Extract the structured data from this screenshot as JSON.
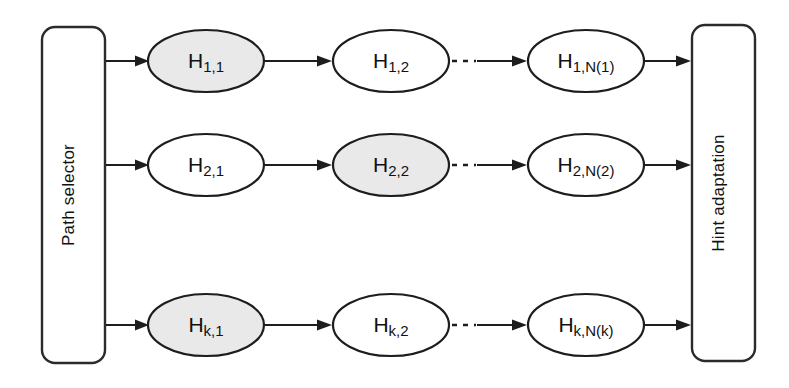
{
  "diagram": {
    "type": "block-flow-diagram",
    "background_color": "#ffffff",
    "stroke_color": "#1d1d1d",
    "shaded_fill_color": "#e9e9e9",
    "plain_fill_color": "#ffffff",
    "left_block": {
      "label": "Path selector",
      "orientation": "vertical-bottom-to-top"
    },
    "right_block": {
      "label": "Hint adaptation",
      "orientation": "vertical-bottom-to-top"
    },
    "rows": [
      {
        "name": "path-1",
        "nodes": [
          {
            "base": "H",
            "sub": "1,1",
            "shaded": true
          },
          {
            "base": "H",
            "sub": "1,2",
            "shaded": false
          },
          {
            "base": "H",
            "sub": "1,N(1)",
            "shaded": false
          }
        ],
        "ellipsis": "· · ·"
      },
      {
        "name": "path-2",
        "nodes": [
          {
            "base": "H",
            "sub": "2,1",
            "shaded": false
          },
          {
            "base": "H",
            "sub": "2,2",
            "shaded": true
          },
          {
            "base": "H",
            "sub": "2,N(2)",
            "shaded": false
          }
        ],
        "ellipsis": "· · ·"
      },
      {
        "name": "path-k",
        "nodes": [
          {
            "base": "H",
            "sub": "k,1",
            "shaded": true
          },
          {
            "base": "H",
            "sub": "k,2",
            "shaded": false
          },
          {
            "base": "H",
            "sub": "k,N(k)",
            "shaded": false
          }
        ],
        "ellipsis": "· · ·"
      }
    ]
  }
}
